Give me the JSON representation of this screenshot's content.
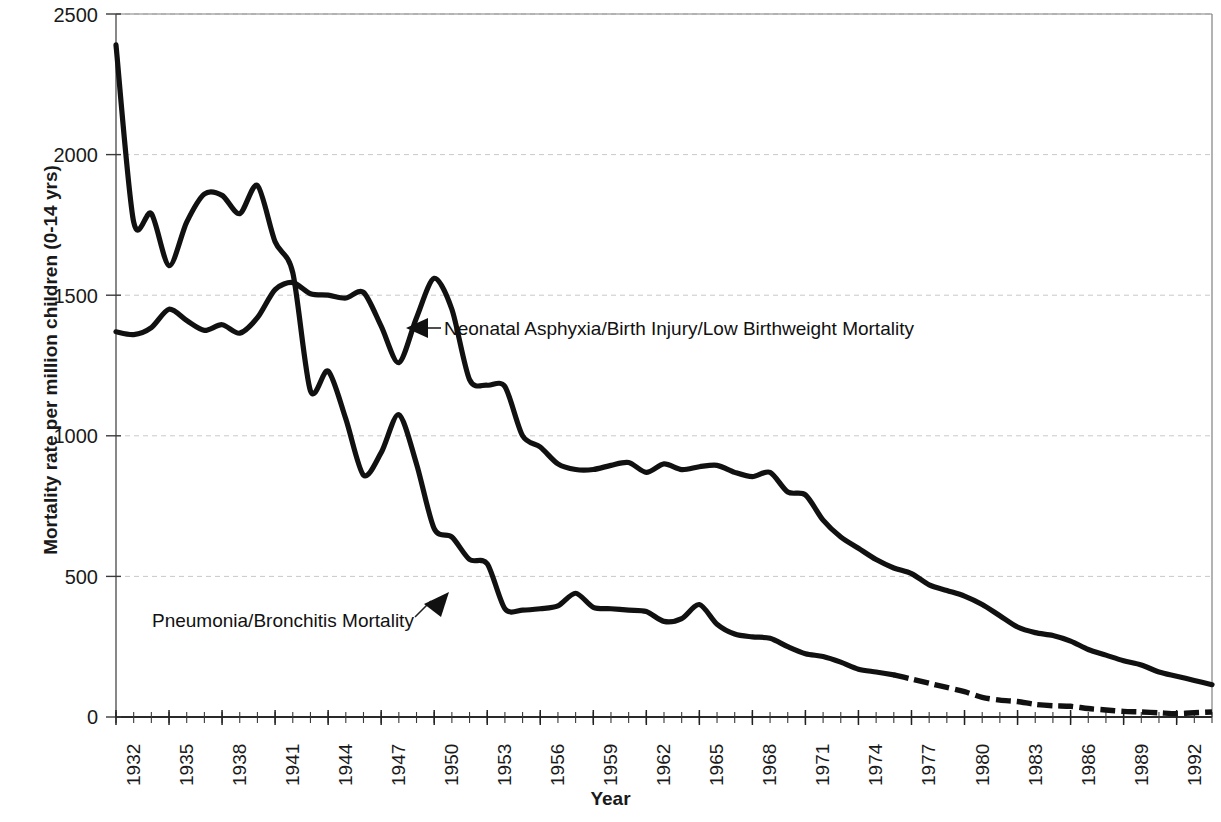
{
  "chart_data": {
    "type": "line",
    "title": "",
    "xlabel": "Year",
    "ylabel": "Mortality rate per million children (0-14 yrs)",
    "xlim": [
      1932,
      1994
    ],
    "ylim": [
      0,
      2500
    ],
    "yticks": [
      0,
      500,
      1000,
      1500,
      2000,
      2500
    ],
    "xticks": [
      1932,
      1935,
      1938,
      1941,
      1944,
      1947,
      1950,
      1953,
      1956,
      1959,
      1962,
      1965,
      1968,
      1971,
      1974,
      1977,
      1980,
      1983,
      1986,
      1989,
      1992
    ],
    "xtick_labels": [
      "1932",
      "1935",
      "1938",
      "1941",
      "1944",
      "1947",
      "1950",
      "1953",
      "1956",
      "1959",
      "1962",
      "1965",
      "1968",
      "1971",
      "1974",
      "1977",
      "1980",
      "1983",
      "1986",
      "1989",
      "1992"
    ],
    "ytick_labels": [
      "0",
      "500",
      "1000",
      "1500",
      "2000",
      "2500"
    ],
    "grid": "horizontal-dashed-light",
    "legend_position": "inline-annotations",
    "x": [
      1932,
      1933,
      1934,
      1935,
      1936,
      1937,
      1938,
      1939,
      1940,
      1941,
      1942,
      1943,
      1944,
      1945,
      1946,
      1947,
      1948,
      1949,
      1950,
      1951,
      1952,
      1953,
      1954,
      1955,
      1956,
      1957,
      1958,
      1959,
      1960,
      1961,
      1962,
      1963,
      1964,
      1965,
      1966,
      1967,
      1968,
      1969,
      1970,
      1971,
      1972,
      1973,
      1974,
      1975,
      1976,
      1977,
      1978,
      1979,
      1980,
      1981,
      1982,
      1983,
      1984,
      1985,
      1986,
      1987,
      1988,
      1989,
      1990,
      1991,
      1992,
      1993,
      1994
    ],
    "series": [
      {
        "name": "Pneumonia/Bronchitis Mortality",
        "color": "#000000",
        "style": "solid-to-dashed",
        "values": [
          2390,
          1760,
          1790,
          1605,
          1760,
          1860,
          1855,
          1790,
          1890,
          1690,
          1580,
          1160,
          1230,
          1060,
          860,
          940,
          1075,
          900,
          670,
          640,
          560,
          545,
          385,
          380,
          385,
          395,
          440,
          390,
          385,
          380,
          375,
          340,
          350,
          400,
          330,
          295,
          285,
          280,
          250,
          225,
          215,
          195,
          170,
          160,
          150,
          135,
          120,
          105,
          90,
          70,
          60,
          55,
          45,
          40,
          38,
          30,
          25,
          20,
          18,
          15,
          12,
          15,
          18
        ]
      },
      {
        "name": "Neonatal Asphyxia/Birth Injury/Low Birthweight Mortality",
        "color": "#000000",
        "style": "solid",
        "values": [
          1370,
          1360,
          1385,
          1450,
          1410,
          1375,
          1395,
          1365,
          1420,
          1520,
          1545,
          1505,
          1500,
          1490,
          1510,
          1390,
          1260,
          1420,
          1560,
          1450,
          1200,
          1180,
          1175,
          1000,
          960,
          900,
          880,
          880,
          895,
          905,
          870,
          900,
          880,
          890,
          895,
          870,
          855,
          870,
          800,
          790,
          700,
          640,
          600,
          560,
          530,
          510,
          470,
          450,
          430,
          400,
          360,
          320,
          300,
          290,
          270,
          240,
          220,
          200,
          185,
          160,
          145,
          130,
          115
        ]
      }
    ],
    "annotations": [
      {
        "text": "Neonatal Asphyxia/Birth Injury/Low Birthweight Mortality",
        "arrow": "left-triangle"
      },
      {
        "text": "Pneumonia/Bronchitis Mortality",
        "arrow": "up-right-triangle"
      }
    ]
  }
}
